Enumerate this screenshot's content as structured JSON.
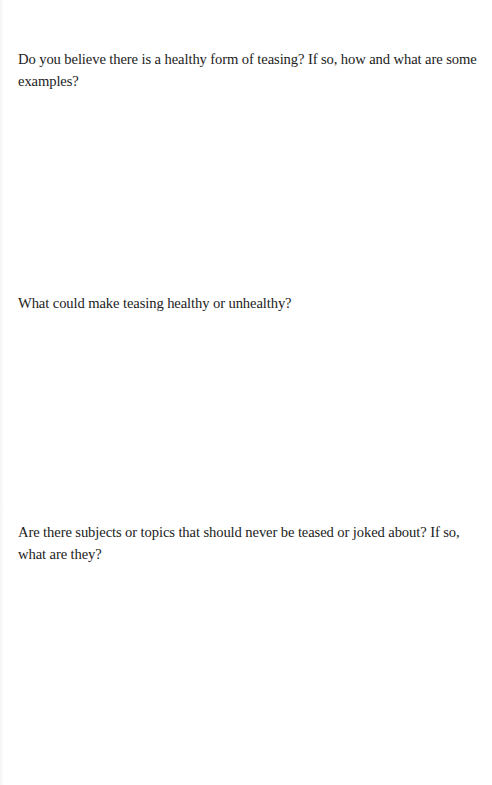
{
  "worksheet": {
    "questions": [
      {
        "text": "Do you believe there is a healthy form of teasing? If so, how and what are some examples?"
      },
      {
        "text": "What could make teasing healthy or unhealthy?"
      },
      {
        "text": "Are there subjects or topics that should never be teased or joked about? If so, what are they?"
      }
    ]
  }
}
